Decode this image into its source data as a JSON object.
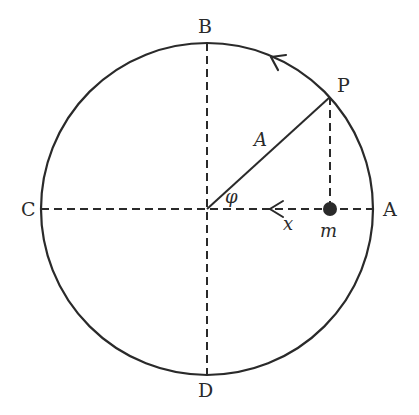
{
  "diagram": {
    "colors": {
      "stroke": "#2a2a2a",
      "background": "#ffffff"
    },
    "circle": {
      "cx": 207,
      "cy": 209,
      "r": 166
    },
    "points": {
      "A": {
        "label": "A",
        "x": 373,
        "y": 209
      },
      "B": {
        "label": "B",
        "x": 207,
        "y": 43
      },
      "C": {
        "label": "C",
        "x": 41,
        "y": 209
      },
      "D": {
        "label": "D",
        "x": 207,
        "y": 375
      },
      "P": {
        "label": "P",
        "x": 330,
        "y": 97
      }
    },
    "labels": {
      "radius": "A",
      "angle": "φ",
      "displacement": "x",
      "mass": "m"
    },
    "mass_position": {
      "x": 330,
      "y": 209
    },
    "rotation_direction": "counterclockwise"
  }
}
